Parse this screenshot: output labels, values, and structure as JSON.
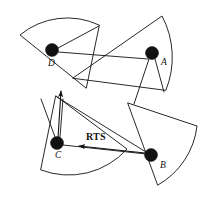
{
  "figure": {
    "type": "diagram",
    "background_color": "#ffffff",
    "stroke_color": "#111111",
    "node_fill_color": "#111111",
    "width": 219,
    "height": 198
  },
  "nodes": [
    {
      "id": "A",
      "label": "A",
      "cx": 152,
      "cy": 53,
      "r": 6.5,
      "label_x": 161,
      "label_y": 65
    },
    {
      "id": "B",
      "label": "B",
      "cx": 151,
      "cy": 155,
      "r": 6.5,
      "label_x": 160,
      "label_y": 168
    },
    {
      "id": "C",
      "label": "C",
      "cx": 57,
      "cy": 143,
      "r": 6.5,
      "label_x": 55,
      "label_y": 158
    },
    {
      "id": "D",
      "label": "D",
      "cx": 52,
      "cy": 50,
      "r": 6.5,
      "label_x": 48,
      "label_y": 66
    }
  ],
  "sectors": [
    {
      "owner": "D",
      "name": "sector-d",
      "path": "M 86 88 L 20 35 A 74 74 0 0 1 99 25 Z"
    },
    {
      "owner": "A",
      "name": "sector-a",
      "path": "M 73 78 L 162 16 A 88 88 0 0 1 166 90 Z"
    },
    {
      "owner": "C",
      "name": "sector-c",
      "path": "M 56 96 L 127 149 A 78 78 0 0 1 41 170 Z"
    },
    {
      "owner": "B",
      "name": "sector-b",
      "path": "M 128 103 L 197 126 A 78 78 0 0 1 158 185 Z"
    }
  ],
  "links": [
    {
      "name": "link-d-a",
      "from": "D",
      "to": "A",
      "x1": 58,
      "y1": 52,
      "x2": 148,
      "y2": 59
    },
    {
      "name": "link-d-sector-edge",
      "from": "D",
      "to": "sector-a-apex",
      "x1": 58,
      "y1": 48,
      "x2": 99,
      "y2": 26
    },
    {
      "name": "link-c-b-lower",
      "from": "C",
      "to": "B",
      "x1": 63,
      "y1": 145,
      "x2": 146,
      "y2": 154
    },
    {
      "name": "link-b-upper",
      "from": "B",
      "to": "sector-c-apex",
      "x1": 146,
      "y1": 152,
      "x2": 57,
      "y2": 97
    },
    {
      "name": "link-a-down-left",
      "from": "A",
      "to": "sector-b-edge",
      "x1": 149,
      "y1": 59,
      "x2": 134,
      "y2": 104
    },
    {
      "name": "link-a-down-right",
      "from": "A",
      "to": "sector-b-edge2",
      "x1": 155,
      "y1": 59,
      "x2": 164,
      "y2": 92
    },
    {
      "name": "link-c-up-left",
      "from": "C",
      "to": "sector-c-edge",
      "x1": 55,
      "y1": 137,
      "x2": 41,
      "y2": 99
    },
    {
      "name": "link-c-up-right",
      "from": "C",
      "to": "sector-c-edge2",
      "x1": 60,
      "y1": 137,
      "x2": 63,
      "y2": 99
    }
  ],
  "arrows": [
    {
      "name": "arrow-c-up",
      "from": "C",
      "direction": "up",
      "x1": 58,
      "y1": 138,
      "x2": 61,
      "y2": 91
    },
    {
      "name": "arrow-rts-b-to-c",
      "from": "B",
      "to": "C",
      "x1": 145,
      "y1": 153,
      "x2": 79,
      "y2": 146
    }
  ],
  "annotations": [
    {
      "name": "rts-label",
      "text": "RTS",
      "x": 86,
      "y": 140
    }
  ]
}
